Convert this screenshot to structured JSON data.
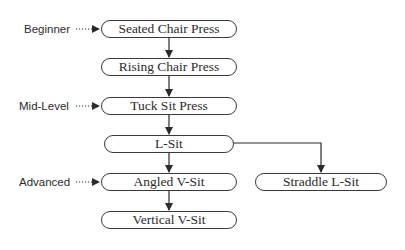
{
  "diagram": {
    "type": "progression-flowchart",
    "levels": [
      {
        "label": "Beginner",
        "points_to": "Seated Chair Press"
      },
      {
        "label": "Mid-Level",
        "points_to": "Tuck Sit Press"
      },
      {
        "label": "Advanced",
        "points_to": "Angled V-Sit"
      }
    ],
    "nodes": [
      {
        "id": "seated",
        "label": "Seated Chair Press"
      },
      {
        "id": "rising",
        "label": "Rising Chair Press"
      },
      {
        "id": "tuck",
        "label": "Tuck Sit Press"
      },
      {
        "id": "lsit",
        "label": "L-Sit"
      },
      {
        "id": "angled",
        "label": "Angled V-Sit"
      },
      {
        "id": "vertical",
        "label": "Vertical V-Sit"
      },
      {
        "id": "straddle",
        "label": "Straddle L-Sit"
      }
    ],
    "edges": [
      {
        "from": "Seated Chair Press",
        "to": "Rising Chair Press"
      },
      {
        "from": "Rising Chair Press",
        "to": "Tuck Sit Press"
      },
      {
        "from": "Tuck Sit Press",
        "to": "L-Sit"
      },
      {
        "from": "L-Sit",
        "to": "Angled V-Sit"
      },
      {
        "from": "L-Sit",
        "to": "Straddle L-Sit"
      },
      {
        "from": "Angled V-Sit",
        "to": "Vertical V-Sit"
      }
    ],
    "colors": {
      "line": "#2b2b2b",
      "border": "#3a3a3a",
      "text": "#2b2b2b",
      "background": "#ffffff"
    }
  }
}
